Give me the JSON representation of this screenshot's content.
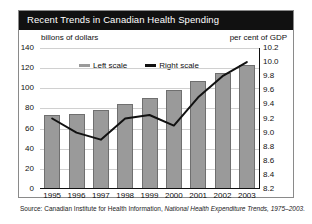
{
  "title": "Recent Trends in Canadian Health Spending",
  "left_axis_caption": "billons of dollars",
  "right_axis_caption": "per cent of GDP",
  "legend": {
    "left": "Left scale",
    "right": "Right scale"
  },
  "source": {
    "prefix": "Source: Canadian Institute for Health Information,",
    "publication": "National Health Expenditure Trends, 1975–2003."
  },
  "colors": {
    "title_bar": "#111111",
    "title_text": "#ffffff",
    "bar_fill": "#9a9a9a",
    "bar_edge": "#6f6f6f",
    "line": "#111111",
    "grid": "#d0d0d0",
    "frame": "#8a8a8a"
  },
  "chart_data": {
    "type": "bar",
    "title": "Recent Trends in Canadian Health Spending",
    "xlabel": "",
    "ylabel": "billons of dollars",
    "y2label": "per cent of GDP",
    "categories": [
      "1995",
      "1996",
      "1997",
      "1998",
      "1999",
      "2000",
      "2001",
      "2002",
      "2003"
    ],
    "ylim": [
      0,
      140
    ],
    "yticks": [
      0,
      20,
      40,
      60,
      80,
      100,
      120,
      140
    ],
    "y2lim": [
      8.2,
      10.2
    ],
    "y2ticks": [
      8.2,
      8.4,
      8.6,
      8.8,
      9.0,
      9.2,
      9.4,
      9.6,
      9.8,
      10.0,
      10.2
    ],
    "grid": true,
    "legend_position": "top-center",
    "series": [
      {
        "name": "Left scale",
        "type": "bar",
        "axis": "left",
        "unit": "billions of dollars",
        "values": [
          74,
          75,
          78,
          84,
          90,
          98,
          107,
          115,
          123
        ]
      },
      {
        "name": "Right scale",
        "type": "line",
        "axis": "right",
        "unit": "per cent of GDP",
        "values": [
          9.2,
          9.0,
          8.9,
          9.2,
          9.25,
          9.1,
          9.5,
          9.8,
          10.0
        ]
      }
    ]
  }
}
